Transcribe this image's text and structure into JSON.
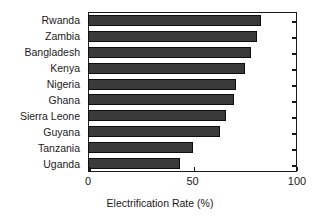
{
  "chart_data": {
    "type": "bar",
    "orientation": "horizontal",
    "title": "",
    "xlabel": "Electrification Rate (%)",
    "ylabel": "",
    "categories": [
      "Rwanda",
      "Zambia",
      "Bangladesh",
      "Kenya",
      "Nigeria",
      "Ghana",
      "Sierra Leone",
      "Guyana",
      "Tanzania",
      "Uganda"
    ],
    "values": [
      83,
      81,
      78,
      75,
      71,
      70,
      66,
      63,
      50,
      44
    ],
    "xlim": [
      0,
      100
    ],
    "xticks": [
      0,
      50,
      100
    ],
    "xtick_labels": [
      "0",
      "50",
      "100"
    ],
    "grid": false,
    "legend": null,
    "bar_color": "#3a3a3a",
    "bar_edge_color": "#0d0d0d",
    "axis_color": "#1a1a1a",
    "background_color": "#ffffff"
  },
  "axis": {
    "x_title": "Electrification Rate (%)"
  }
}
